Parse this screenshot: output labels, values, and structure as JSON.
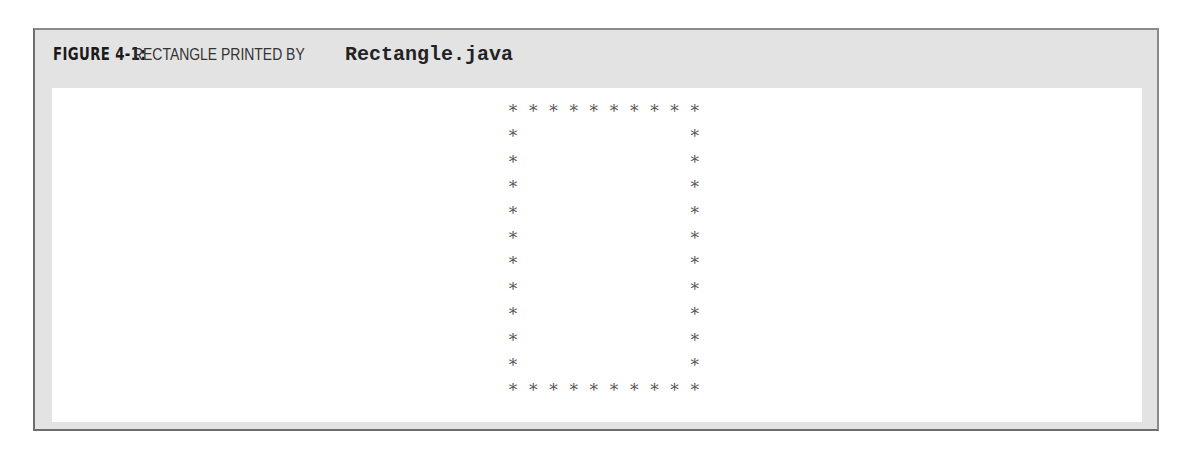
{
  "figure": {
    "label": "FIGURE 4-1:",
    "caption_text": "RECTANGLE PRINTED BY",
    "caption_code": "Rectangle.java"
  },
  "output": {
    "rows": [
      "**********",
      "*        *",
      "*        *",
      "*        *",
      "*        *",
      "*        *",
      "*        *",
      "*        *",
      "*        *",
      "*        *",
      "*        *",
      "**********"
    ],
    "width_chars": 10,
    "height_rows": 12
  },
  "colors": {
    "frame_background": "#e3e3e3",
    "frame_border": "#6e6e6e",
    "panel_background": "#ffffff",
    "asterisk": "#555555"
  }
}
